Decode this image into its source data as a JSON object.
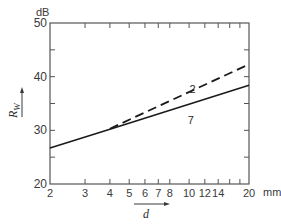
{
  "chart_data": {
    "type": "line",
    "title": "",
    "xlabel": "d",
    "xunit": "mm",
    "ylabel": "R_W",
    "ylabel_main": "R",
    "ylabel_sub": "W",
    "yunit": "dB",
    "xscale": "log",
    "xlim": [
      2,
      20
    ],
    "ylim": [
      20,
      50
    ],
    "x_ticks": [
      2,
      3,
      4,
      5,
      6,
      7,
      8,
      10,
      12,
      14,
      20
    ],
    "x_tick_labels": [
      "2",
      "3",
      "4",
      "5",
      "6",
      "7",
      "8",
      "10",
      "12",
      "14",
      "20"
    ],
    "x_minor_ticks": [
      16,
      18
    ],
    "y_ticks": [
      20,
      30,
      40,
      50
    ],
    "y_tick_labels": [
      "20",
      "30",
      "40",
      "50"
    ],
    "y_minor_ticks": [
      25,
      35,
      45
    ],
    "grid": false,
    "series": [
      {
        "name": "7",
        "style": "solid",
        "x": [
          2,
          4,
          20
        ],
        "y": [
          26.7,
          30.2,
          38.4
        ],
        "label_at": {
          "x": 10.2,
          "y": 31.2
        }
      },
      {
        "name": "2",
        "style": "dashed",
        "x": [
          4,
          20
        ],
        "y": [
          30.3,
          42.3
        ],
        "label_at": {
          "x": 10.4,
          "y": 37.0
        }
      }
    ],
    "colors": {
      "line": "#1a1a1a",
      "axis": "#555555",
      "text": "#3a3a3a"
    }
  }
}
